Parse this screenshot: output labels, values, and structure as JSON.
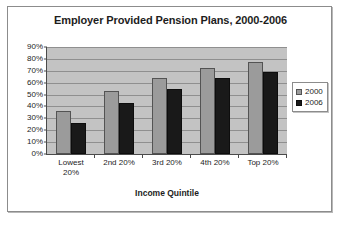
{
  "chart_data": {
    "type": "bar",
    "title": "Employer Provided Pension Plans, 2000-2006",
    "xlabel": "Income Quintile",
    "ylabel": "",
    "categories": [
      "Lowest 20%",
      "2nd 20%",
      "3rd 20%",
      "4th 20%",
      "Top 20%"
    ],
    "category_lines": [
      [
        "Lowest",
        "20%"
      ],
      [
        "2nd 20%"
      ],
      [
        "3rd 20%"
      ],
      [
        "4th 20%"
      ],
      [
        "Top 20%"
      ]
    ],
    "series": [
      {
        "name": "2000",
        "color": "#9b9b9b",
        "values": [
          36,
          53,
          64,
          72,
          77
        ]
      },
      {
        "name": "2006",
        "color": "#191919",
        "values": [
          26,
          43,
          55,
          64,
          69
        ]
      }
    ],
    "ylim": [
      0,
      90
    ],
    "ytick_values": [
      0,
      10,
      20,
      30,
      40,
      50,
      60,
      70,
      80,
      90
    ],
    "ytick_labels": [
      "0%",
      "10%",
      "20%",
      "30%",
      "40%",
      "50%",
      "60%",
      "70%",
      "80%",
      "90%"
    ],
    "grid": true,
    "legend_position": "right",
    "plot_background": "#c3c3c3",
    "frame_background": "#ffffff"
  }
}
